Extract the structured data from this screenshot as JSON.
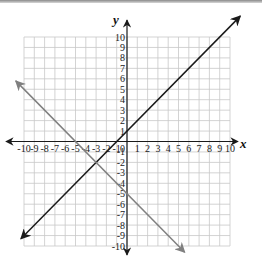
{
  "chart_data": {
    "type": "line",
    "title": "",
    "xlabel": "x",
    "ylabel": "y",
    "xlim": [
      -10,
      10
    ],
    "ylim": [
      -10,
      10
    ],
    "grid": true,
    "x_ticks": [
      -10,
      -9,
      -8,
      -7,
      -6,
      -5,
      -4,
      -3,
      -2,
      -1,
      1,
      2,
      3,
      4,
      5,
      6,
      7,
      8,
      9,
      10
    ],
    "y_ticks": [
      10,
      9,
      8,
      7,
      6,
      5,
      4,
      3,
      2,
      1,
      -1,
      -2,
      -3,
      -4,
      -5,
      -6,
      -7,
      -8,
      -9,
      -10
    ],
    "series": [
      {
        "name": "black line",
        "equation": "y = x + 1",
        "color": "#1a1a1a",
        "points": [
          [
            -10.3,
            -9.3
          ],
          [
            0,
            1
          ],
          [
            -1,
            0
          ],
          [
            11,
            12
          ]
        ],
        "arrows": "both"
      },
      {
        "name": "gray line",
        "equation": "y = -x - 5",
        "color": "#808080",
        "points": [
          [
            -10.8,
            5.8
          ],
          [
            -5,
            0
          ],
          [
            0,
            -5
          ],
          [
            5.6,
            -10.6
          ]
        ],
        "arrows": "both"
      }
    ],
    "intersection": [
      -3,
      -2
    ]
  },
  "colors": {
    "grid": "#c8c8c8",
    "axis": "#1a1a1a",
    "line_primary": "#1a1a1a",
    "line_secondary": "#808080"
  }
}
